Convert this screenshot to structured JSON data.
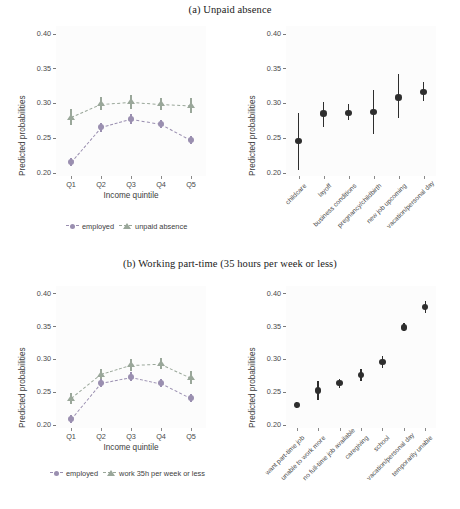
{
  "figure": {
    "panels": [
      {
        "id": "a",
        "caption": "(a) Unpaid absence",
        "left": {
          "ylabel": "Predicted probabilities",
          "xlabel": "Income quintile",
          "yticks": [
            "0.20",
            "0.25",
            "0.30",
            "0.35",
            "0.40"
          ],
          "xticks": [
            "Q1",
            "Q2",
            "Q3",
            "Q4",
            "Q5"
          ],
          "legend": [
            {
              "label": "employed",
              "marker": "circle",
              "color": "#9a8fb0"
            },
            {
              "label": "unpaid absence",
              "marker": "triangle",
              "color": "#9aa79a"
            }
          ]
        },
        "right": {
          "ylabel": "Predicted probabilities",
          "yticks": [
            "0.20",
            "0.25",
            "0.30",
            "0.35",
            "0.40"
          ],
          "xticks": [
            "childcare",
            "layoff",
            "business conditions",
            "pregnancy/childbirth",
            "new job upcoming",
            "vacation/personal day"
          ]
        }
      },
      {
        "id": "b",
        "caption": "(b) Working part-time (35 hours per week or less)",
        "left": {
          "ylabel": "Predicted probabilities",
          "xlabel": "Income quintile",
          "yticks": [
            "0.20",
            "0.25",
            "0.30",
            "0.35",
            "0.40"
          ],
          "xticks": [
            "Q1",
            "Q2",
            "Q3",
            "Q4",
            "Q5"
          ],
          "legend": [
            {
              "label": "employed",
              "marker": "circle",
              "color": "#9a8fb0"
            },
            {
              "label": "work 35h per week or less",
              "marker": "triangle",
              "color": "#9aa79a"
            }
          ]
        },
        "right": {
          "ylabel": "Predicted probabilities",
          "yticks": [
            "0.20",
            "0.25",
            "0.30",
            "0.35",
            "0.40"
          ],
          "xticks": [
            "want part-time job",
            "unable to work more",
            "no full-time job available",
            "caregiving",
            "school",
            "vacation/personal day",
            "temporarily unable"
          ]
        }
      }
    ]
  },
  "chart_data": [
    {
      "id": "a-left",
      "type": "line",
      "title": "(a) Unpaid absence",
      "xlabel": "Income quintile",
      "ylabel": "Predicted probabilities",
      "categories": [
        "Q1",
        "Q2",
        "Q3",
        "Q4",
        "Q5"
      ],
      "ylim": [
        0.195,
        0.41
      ],
      "yticks": [
        0.2,
        0.25,
        0.3,
        0.35,
        0.4
      ],
      "grid": false,
      "legend_position": "bottom",
      "series": [
        {
          "name": "employed",
          "color": "#9a8fb0",
          "marker": "circle",
          "values": [
            0.215,
            0.265,
            0.277,
            0.27,
            0.247
          ],
          "ci_low": [
            0.209,
            0.259,
            0.27,
            0.264,
            0.241
          ],
          "ci_high": [
            0.221,
            0.271,
            0.284,
            0.276,
            0.253
          ]
        },
        {
          "name": "unpaid absence",
          "color": "#9aa79a",
          "marker": "triangle",
          "values": [
            0.28,
            0.299,
            0.302,
            0.299,
            0.297
          ],
          "ci_low": [
            0.269,
            0.29,
            0.292,
            0.29,
            0.286
          ],
          "ci_high": [
            0.291,
            0.309,
            0.312,
            0.308,
            0.308
          ]
        }
      ]
    },
    {
      "id": "a-right",
      "type": "scatter",
      "title": "(a) Unpaid absence — reasons",
      "xlabel": "",
      "ylabel": "Predicted probabilities",
      "categories": [
        "childcare",
        "layoff",
        "business conditions",
        "pregnancy/childbirth",
        "new job upcoming",
        "vacation/personal day"
      ],
      "ylim": [
        0.195,
        0.41
      ],
      "yticks": [
        0.2,
        0.25,
        0.3,
        0.35,
        0.4
      ],
      "grid": false,
      "legend_position": "none",
      "color": "#2e2e2e",
      "values": [
        0.245,
        0.285,
        0.286,
        0.287,
        0.308,
        0.316
      ],
      "ci_low": [
        0.204,
        0.266,
        0.275,
        0.256,
        0.278,
        0.303
      ],
      "ci_high": [
        0.286,
        0.302,
        0.298,
        0.319,
        0.342,
        0.33
      ]
    },
    {
      "id": "b-left",
      "type": "line",
      "title": "(b) Working part-time (35 hours per week or less)",
      "xlabel": "Income quintile",
      "ylabel": "Predicted probabilities",
      "categories": [
        "Q1",
        "Q2",
        "Q3",
        "Q4",
        "Q5"
      ],
      "ylim": [
        0.195,
        0.41
      ],
      "yticks": [
        0.2,
        0.25,
        0.3,
        0.35,
        0.4
      ],
      "grid": false,
      "legend_position": "bottom",
      "series": [
        {
          "name": "employed",
          "color": "#9a8fb0",
          "marker": "circle",
          "values": [
            0.209,
            0.264,
            0.273,
            0.263,
            0.24
          ],
          "ci_low": [
            0.203,
            0.258,
            0.266,
            0.257,
            0.234
          ],
          "ci_high": [
            0.215,
            0.27,
            0.28,
            0.269,
            0.246
          ]
        },
        {
          "name": "work 35h per week or less",
          "color": "#9aa79a",
          "marker": "triangle",
          "values": [
            0.24,
            0.277,
            0.291,
            0.293,
            0.272
          ],
          "ci_low": [
            0.231,
            0.269,
            0.282,
            0.284,
            0.262
          ],
          "ci_high": [
            0.249,
            0.285,
            0.3,
            0.302,
            0.282
          ]
        }
      ]
    },
    {
      "id": "b-right",
      "type": "scatter",
      "title": "(b) Working part-time — reasons",
      "xlabel": "",
      "ylabel": "Predicted probabilities",
      "categories": [
        "want part-time job",
        "unable to work more",
        "no full-time job available",
        "caregiving",
        "school",
        "vacation/personal day",
        "temporarily unable"
      ],
      "ylim": [
        0.195,
        0.41
      ],
      "yticks": [
        0.2,
        0.25,
        0.3,
        0.35,
        0.4
      ],
      "grid": false,
      "legend_position": "none",
      "color": "#2e2e2e",
      "values": [
        0.23,
        0.252,
        0.263,
        0.276,
        0.295,
        0.348,
        0.379
      ],
      "ci_low": [
        0.225,
        0.238,
        0.256,
        0.267,
        0.286,
        0.342,
        0.37
      ],
      "ci_high": [
        0.235,
        0.266,
        0.27,
        0.285,
        0.304,
        0.354,
        0.388
      ]
    }
  ]
}
